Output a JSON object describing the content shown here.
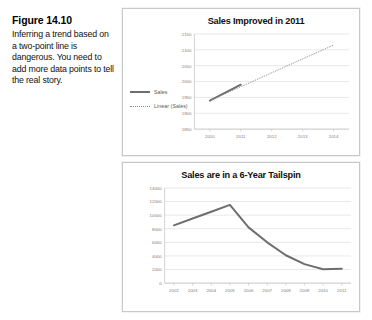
{
  "figure": {
    "label": "Figure 14.10",
    "caption": "Inferring a trend based on a two-point line is dangerous. You need to add more data points to tell the real story."
  },
  "colors": {
    "series_line": "#6e6e6e",
    "trendline": "#8a8a8a",
    "gridline": "#d9d9d9",
    "axis": "#bfbfbf",
    "tick_label": "#808080",
    "panel_border": "#c8c8c8"
  },
  "chart_data": [
    {
      "id": "top",
      "type": "line",
      "title": "Sales Improved in 2011",
      "xlabel": "",
      "ylabel": "",
      "grid": true,
      "legend_position": "left",
      "x": [
        2010,
        2011,
        2012,
        2013,
        2014
      ],
      "xticklabels": [
        "2010",
        "2011",
        "2012",
        "2013",
        "2014"
      ],
      "ylim": [
        1850,
        2150
      ],
      "yticks": [
        1850,
        1900,
        1950,
        2000,
        2050,
        2100,
        2150
      ],
      "yticklabels": [
        "1850",
        "1900",
        "1950",
        "2000",
        "2050",
        "2100",
        "2150"
      ],
      "series": [
        {
          "name": "Sales",
          "style": "solid",
          "x": [
            2010,
            2011
          ],
          "values": [
            1940,
            1990
          ]
        },
        {
          "name": "Linear (Sales)",
          "style": "dotted",
          "x": [
            2010,
            2014
          ],
          "values": [
            1940,
            2115
          ]
        }
      ]
    },
    {
      "id": "bottom",
      "type": "line",
      "title": "Sales are in a 6-Year Tailspin",
      "xlabel": "",
      "ylabel": "",
      "grid": true,
      "legend_position": "none",
      "x": [
        2002,
        2003,
        2004,
        2005,
        2006,
        2007,
        2008,
        2009,
        2010,
        2011
      ],
      "xticklabels": [
        "2002",
        "2003",
        "2004",
        "2005",
        "2006",
        "2007",
        "2008",
        "2009",
        "2010",
        "2011"
      ],
      "ylim": [
        0,
        14000
      ],
      "yticks": [
        0,
        2000,
        4000,
        6000,
        8000,
        10000,
        12000,
        14000
      ],
      "yticklabels": [
        "0",
        "2000",
        "4000",
        "6000",
        "8000",
        "10000",
        "12000",
        "14000"
      ],
      "series": [
        {
          "name": "Sales",
          "style": "solid",
          "x": [
            2002,
            2003,
            2004,
            2005,
            2006,
            2007,
            2008,
            2009,
            2010,
            2011
          ],
          "values": [
            8500,
            9500,
            10500,
            11500,
            8200,
            6000,
            4100,
            2800,
            2050,
            2100
          ]
        }
      ]
    }
  ]
}
